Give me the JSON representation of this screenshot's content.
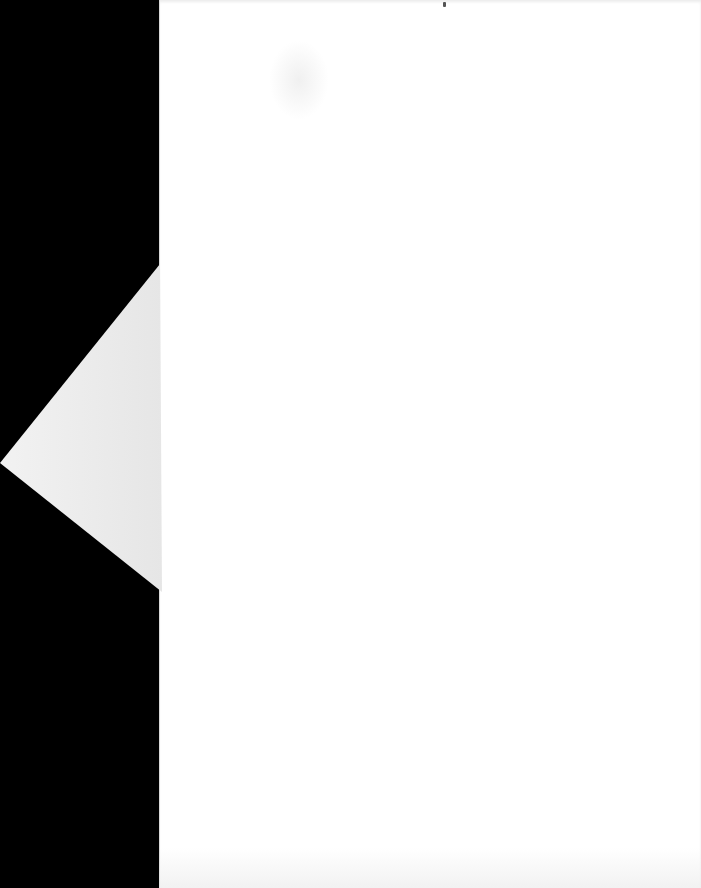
{
  "document": {
    "type": "scanned-page",
    "content": "",
    "colors": {
      "background": "#000000",
      "paper": "#ffffff",
      "flap": "#ececec"
    }
  }
}
